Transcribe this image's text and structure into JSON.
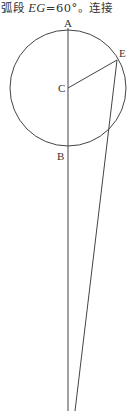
{
  "caption": {
    "prefix": "弧段 ",
    "var": "EG",
    "mid": "=60°。",
    "suffix": "连接"
  },
  "figure": {
    "labels": {
      "A": "A",
      "B": "B",
      "C": "C",
      "E": "E"
    },
    "stroke_color": "#444444"
  }
}
